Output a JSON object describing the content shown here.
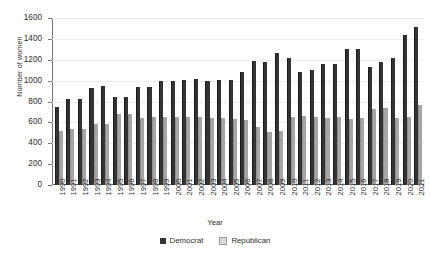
{
  "chart_data": {
    "type": "bar",
    "title": "",
    "xlabel": "Year",
    "ylabel": "Number of women",
    "ylim": [
      0,
      1600
    ],
    "ytick_step": 200,
    "yticks": [
      1600,
      1400,
      1200,
      1000,
      800,
      600,
      400,
      200,
      0
    ],
    "grid": true,
    "legend_position": "bottom",
    "categories": [
      "1990",
      "1991",
      "1992",
      "1993",
      "1994",
      "1995",
      "1996",
      "1997",
      "1998",
      "1999",
      "2000",
      "2001",
      "2002",
      "2003",
      "2004",
      "2005",
      "2006",
      "2007",
      "2008",
      "2009",
      "2010",
      "2011",
      "2012",
      "2013",
      "2014",
      "2015",
      "2016",
      "2017",
      "2018",
      "2019",
      "2020",
      "2021"
    ],
    "series": [
      {
        "name": "Democrat",
        "color": "#333333",
        "values": [
          745,
          820,
          825,
          925,
          950,
          845,
          845,
          940,
          940,
          995,
          1000,
          1005,
          1015,
          995,
          1010,
          1010,
          1080,
          1185,
          1180,
          1265,
          1215,
          1080,
          1100,
          1155,
          1160,
          1300,
          1300,
          1135,
          1175,
          1215,
          1440,
          1510
        ]
      },
      {
        "name": "Republican",
        "color": "#a6a6a6",
        "values": [
          515,
          535,
          540,
          585,
          585,
          680,
          685,
          645,
          650,
          650,
          655,
          650,
          650,
          645,
          640,
          635,
          625,
          560,
          510,
          520,
          655,
          660,
          650,
          645,
          650,
          635,
          640,
          730,
          735,
          640,
          650,
          770
        ]
      }
    ]
  },
  "legend": {
    "items": [
      {
        "label": "Democrat",
        "swatch": "dark-square-swatch"
      },
      {
        "label": "Republican",
        "swatch": "light-square-swatch"
      }
    ]
  }
}
